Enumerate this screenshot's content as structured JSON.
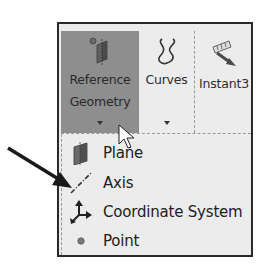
{
  "toolbar": {
    "buttons": [
      {
        "id": "reference-geometry",
        "label_line1": "Reference",
        "label_line2": "Geometry",
        "icon": "reference-geometry-icon",
        "has_dropdown": true,
        "state": "active"
      },
      {
        "id": "curves",
        "label": "Curves",
        "icon": "curves-icon",
        "has_dropdown": true
      },
      {
        "id": "instant3d",
        "label": "Instant3",
        "icon": "instant3d-icon",
        "has_dropdown": false
      }
    ]
  },
  "menu": {
    "items": [
      {
        "label": "Plane",
        "icon": "plane-icon"
      },
      {
        "label": "Axis",
        "icon": "axis-icon"
      },
      {
        "label": "Coordinate System",
        "icon": "coordinate-system-icon"
      },
      {
        "label": "Point",
        "icon": "point-icon"
      }
    ]
  },
  "annotation": {
    "pointer_arrow_target": "Axis"
  },
  "colors": {
    "active_button_bg": "#8e8e8e",
    "panel_bg": "#ececec",
    "frame_border": "#2a2a2a"
  }
}
